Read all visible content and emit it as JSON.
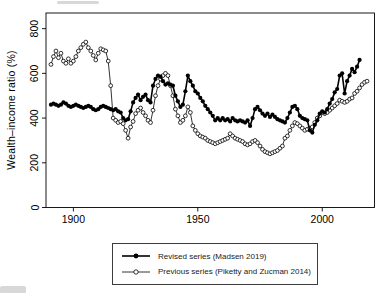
{
  "figure": {
    "background": "#ffffff",
    "foreground": "#000000"
  },
  "chart_data": {
    "type": "line",
    "title": "",
    "xlabel": "",
    "ylabel": "Wealth–income ratio (%)",
    "xlim": [
      1889,
      2021
    ],
    "ylim": [
      0,
      870
    ],
    "x_ticks": [
      1900,
      1950,
      2000
    ],
    "y_ticks": [
      0,
      200,
      400,
      600,
      800
    ],
    "grid": false,
    "legend_position": "below-chart, boxed",
    "series": [
      {
        "name": "Revised series (Madsen 2019)",
        "marker": "filled-circle",
        "color": "#000000",
        "line_width": 1.6,
        "x": [
          1891,
          1892,
          1893,
          1894,
          1895,
          1896,
          1897,
          1898,
          1899,
          1900,
          1901,
          1902,
          1903,
          1904,
          1905,
          1906,
          1907,
          1908,
          1909,
          1910,
          1911,
          1912,
          1913,
          1914,
          1915,
          1916,
          1917,
          1918,
          1919,
          1920,
          1921,
          1922,
          1923,
          1924,
          1925,
          1926,
          1927,
          1928,
          1929,
          1930,
          1931,
          1932,
          1933,
          1934,
          1935,
          1936,
          1937,
          1938,
          1939,
          1940,
          1941,
          1942,
          1943,
          1944,
          1945,
          1946,
          1947,
          1948,
          1949,
          1950,
          1951,
          1952,
          1953,
          1954,
          1955,
          1956,
          1957,
          1958,
          1959,
          1960,
          1961,
          1962,
          1963,
          1964,
          1965,
          1966,
          1967,
          1968,
          1969,
          1970,
          1971,
          1972,
          1973,
          1974,
          1975,
          1976,
          1977,
          1978,
          1979,
          1980,
          1981,
          1982,
          1983,
          1984,
          1985,
          1986,
          1987,
          1988,
          1989,
          1990,
          1991,
          1992,
          1993,
          1994,
          1995,
          1996,
          1997,
          1998,
          1999,
          2000,
          2001,
          2002,
          2003,
          2004,
          2005,
          2006,
          2007,
          2008,
          2009,
          2010,
          2011,
          2012,
          2013,
          2014,
          2015
        ],
        "values": [
          460,
          465,
          460,
          455,
          460,
          470,
          465,
          455,
          450,
          455,
          460,
          455,
          450,
          445,
          450,
          455,
          450,
          440,
          435,
          440,
          450,
          455,
          450,
          445,
          440,
          435,
          440,
          430,
          425,
          400,
          390,
          395,
          430,
          470,
          490,
          505,
          480,
          495,
          505,
          480,
          470,
          545,
          575,
          590,
          585,
          565,
          550,
          555,
          550,
          545,
          500,
          475,
          450,
          460,
          520,
          590,
          565,
          545,
          520,
          510,
          490,
          475,
          455,
          440,
          425,
          410,
          390,
          400,
          390,
          400,
          390,
          395,
          385,
          400,
          390,
          385,
          390,
          385,
          380,
          390,
          365,
          400,
          440,
          450,
          435,
          420,
          410,
          420,
          405,
          415,
          405,
          395,
          390,
          385,
          380,
          400,
          425,
          450,
          455,
          440,
          410,
          400,
          395,
          390,
          345,
          335,
          370,
          390,
          420,
          430,
          425,
          440,
          465,
          485,
          515,
          530,
          590,
          600,
          510,
          565,
          590,
          620,
          605,
          630,
          660
        ]
      },
      {
        "name": "Previous series (Piketty and Zucman 2014)",
        "marker": "open-circle",
        "color": "#000000",
        "line_width": 0.8,
        "x": [
          1891,
          1892,
          1893,
          1894,
          1895,
          1896,
          1897,
          1898,
          1899,
          1900,
          1901,
          1902,
          1903,
          1904,
          1905,
          1906,
          1907,
          1908,
          1909,
          1910,
          1911,
          1912,
          1913,
          1914,
          1915,
          1916,
          1917,
          1918,
          1919,
          1920,
          1921,
          1922,
          1923,
          1924,
          1925,
          1926,
          1927,
          1928,
          1929,
          1930,
          1931,
          1932,
          1933,
          1934,
          1935,
          1936,
          1937,
          1938,
          1939,
          1940,
          1941,
          1942,
          1943,
          1944,
          1945,
          1946,
          1947,
          1948,
          1949,
          1950,
          1951,
          1952,
          1953,
          1954,
          1955,
          1956,
          1957,
          1958,
          1959,
          1960,
          1961,
          1962,
          1963,
          1964,
          1965,
          1966,
          1967,
          1968,
          1969,
          1970,
          1971,
          1972,
          1973,
          1974,
          1975,
          1976,
          1977,
          1978,
          1979,
          1980,
          1981,
          1982,
          1983,
          1984,
          1985,
          1986,
          1987,
          1988,
          1989,
          1990,
          1991,
          1992,
          1993,
          1994,
          1995,
          1996,
          1997,
          1998,
          1999,
          2000,
          2001,
          2002,
          2003,
          2004,
          2005,
          2006,
          2007,
          2008,
          2009,
          2010,
          2011,
          2012,
          2013,
          2014,
          2015,
          2016,
          2017,
          2018
        ],
        "values": [
          640,
          675,
          700,
          670,
          690,
          655,
          645,
          665,
          645,
          655,
          675,
          700,
          715,
          730,
          740,
          715,
          700,
          680,
          660,
          690,
          710,
          705,
          700,
          655,
          545,
          400,
          390,
          380,
          385,
          375,
          345,
          310,
          360,
          385,
          420,
          435,
          445,
          425,
          410,
          390,
          380,
          435,
          500,
          545,
          575,
          590,
          600,
          590,
          545,
          500,
          440,
          410,
          380,
          390,
          410,
          450,
          425,
          365,
          345,
          330,
          320,
          315,
          310,
          300,
          295,
          290,
          285,
          290,
          295,
          300,
          305,
          310,
          330,
          320,
          310,
          305,
          300,
          295,
          285,
          280,
          285,
          295,
          300,
          290,
          275,
          260,
          250,
          245,
          240,
          245,
          250,
          255,
          265,
          275,
          310,
          320,
          345,
          365,
          380,
          375,
          365,
          355,
          345,
          350,
          355,
          360,
          380,
          400,
          410,
          425,
          420,
          425,
          435,
          445,
          455,
          465,
          480,
          475,
          470,
          475,
          485,
          490,
          510,
          520,
          535,
          550,
          560,
          565
        ]
      }
    ]
  },
  "axes": {
    "y_label": "Wealth–income ratio (%)",
    "y_tick_labels": [
      "0",
      "200",
      "400",
      "600",
      "800"
    ],
    "x_tick_labels": [
      "1900",
      "1950",
      "2000"
    ]
  },
  "legend": {
    "items": [
      {
        "label": "Revised series (Madsen 2019)",
        "marker": "filled-circle"
      },
      {
        "label": "Previous series (Piketty and Zucman 2014)",
        "marker": "open-circle"
      }
    ]
  }
}
